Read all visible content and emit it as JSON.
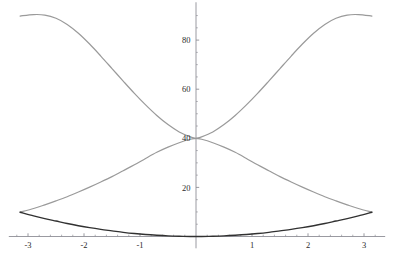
{
  "chart_data": {
    "type": "line",
    "title": "",
    "subtitle": "",
    "xlabel": "",
    "ylabel": "",
    "xlim": [
      -3.45,
      3.45
    ],
    "ylim": [
      -4,
      95
    ],
    "grid": false,
    "legend_position": "none",
    "axis_style": "centered-cross",
    "x_ticks_major": [
      -3,
      -2,
      -1,
      1,
      2,
      3
    ],
    "x_tick_labels": [
      "-3",
      "-2",
      "-1",
      "1",
      "2",
      "3"
    ],
    "x_ticks_minor": [
      -3.2,
      -2.8,
      -2.6,
      -2.4,
      -2.2,
      -1.8,
      -1.6,
      -1.4,
      -1.2,
      -0.8,
      -0.6,
      -0.4,
      -0.2,
      0.2,
      0.4,
      0.6,
      0.8,
      1.2,
      1.4,
      1.6,
      1.8,
      2.2,
      2.4,
      2.6,
      2.8,
      3.2
    ],
    "y_ticks_major": [
      20,
      40,
      60,
      80
    ],
    "y_tick_labels": [
      "20",
      "40",
      "60",
      "80"
    ],
    "y_ticks_minor": [
      5,
      10,
      15,
      25,
      30,
      35,
      45,
      50,
      55,
      65,
      70,
      75,
      85,
      90
    ],
    "series": [
      {
        "name": "rising-gray-curve",
        "color": "#9a9a9a",
        "width": 1.2,
        "x": [
          -3.1416,
          -2.9,
          -2.7,
          -2.5,
          -2.3,
          -2.1,
          -1.9,
          -1.7,
          -1.5,
          -1.3,
          -1.1,
          -0.9,
          -0.7,
          -0.5,
          -0.3,
          -0.1,
          0,
          0.1,
          0.3,
          0.5,
          0.7,
          0.9,
          1.1,
          1.3,
          1.5,
          1.7,
          1.9,
          2.1,
          2.3,
          2.5,
          2.7,
          2.9,
          3.1416
        ],
        "values": [
          9.9,
          11.4,
          12.9,
          14.5,
          16.2,
          18.1,
          20.1,
          22.2,
          24.4,
          26.8,
          29.2,
          31.8,
          34.3,
          36.4,
          38.2,
          39.6,
          40.0,
          40.6,
          42.6,
          45.6,
          49.3,
          53.6,
          58.3,
          63.3,
          68.4,
          73.5,
          78.4,
          82.8,
          86.4,
          88.9,
          90.2,
          90.4,
          89.8
        ]
      },
      {
        "name": "falling-gray-curve",
        "color": "#9a9a9a",
        "width": 1.2,
        "x": [
          -3.1416,
          -2.9,
          -2.7,
          -2.5,
          -2.3,
          -2.1,
          -1.9,
          -1.7,
          -1.5,
          -1.3,
          -1.1,
          -0.9,
          -0.7,
          -0.5,
          -0.3,
          -0.1,
          0,
          0.1,
          0.3,
          0.5,
          0.7,
          0.9,
          1.1,
          1.3,
          1.5,
          1.7,
          1.9,
          2.1,
          2.3,
          2.5,
          2.7,
          2.9,
          3.1416
        ],
        "values": [
          89.8,
          90.4,
          90.2,
          88.9,
          86.4,
          82.8,
          78.4,
          73.5,
          68.4,
          63.3,
          58.3,
          53.6,
          49.3,
          45.6,
          42.6,
          40.6,
          40.0,
          39.6,
          38.2,
          36.4,
          34.3,
          31.8,
          29.2,
          26.8,
          24.4,
          22.2,
          20.1,
          18.1,
          16.2,
          14.5,
          12.9,
          11.4,
          9.9
        ]
      },
      {
        "name": "dark-bottom-curve",
        "color": "#313131",
        "width": 1.4,
        "x": [
          -3.1416,
          -2.9,
          -2.7,
          -2.5,
          -2.3,
          -2.1,
          -1.9,
          -1.7,
          -1.5,
          -1.3,
          -1.1,
          -0.9,
          -0.7,
          -0.5,
          -0.3,
          -0.1,
          0,
          0.1,
          0.3,
          0.5,
          0.7,
          0.9,
          1.1,
          1.3,
          1.5,
          1.7,
          1.9,
          2.1,
          2.3,
          2.5,
          2.7,
          2.9,
          3.1416
        ],
        "values": [
          9.9,
          8.4,
          7.3,
          6.3,
          5.3,
          4.4,
          3.6,
          2.9,
          2.3,
          1.7,
          1.2,
          0.8,
          0.5,
          0.25,
          0.09,
          0.01,
          0.0,
          0.01,
          0.09,
          0.25,
          0.5,
          0.8,
          1.2,
          1.7,
          2.3,
          2.9,
          3.6,
          4.4,
          5.3,
          6.3,
          7.3,
          8.4,
          9.9
        ]
      }
    ],
    "annotations": [
      {
        "name": "curves-crossing-point",
        "x": 0,
        "y": 40
      },
      {
        "name": "left-convergence-point",
        "x": -3.1416,
        "y": 9.9
      },
      {
        "name": "right-convergence-point",
        "x": 3.1416,
        "y": 9.9
      }
    ],
    "colors": {
      "axis": "#8f8f96",
      "gray_curve": "#9a9a9a",
      "dark_curve": "#313131",
      "tick_text": "#2b2b2b",
      "background": "#ffffff"
    }
  }
}
